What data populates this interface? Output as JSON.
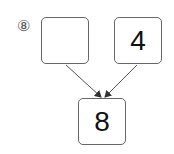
{
  "problem": {
    "number_label": "⑧",
    "boxes": {
      "left": "",
      "right": "4",
      "bottom": "8"
    }
  }
}
